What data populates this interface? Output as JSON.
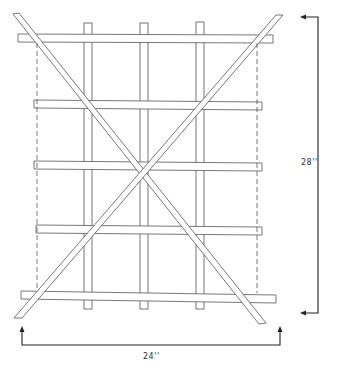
{
  "diagram": {
    "colors": {
      "line": "#444444",
      "background": "#ffffff",
      "dim": "#222222"
    },
    "dimensions": {
      "height_label": "28''",
      "width_label": "24''"
    },
    "vertical_slats": 3,
    "horizontal_bars": 5,
    "diagonal_braces": 2
  }
}
